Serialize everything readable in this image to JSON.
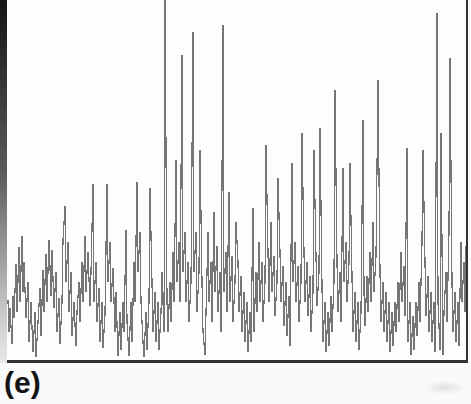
{
  "panel": {
    "label": "(e)"
  },
  "colors": {
    "background": "#fafafa",
    "plot_background": "#fdfdfd",
    "waveform": "#767676",
    "frame": "#323232",
    "label": "#141414",
    "scan_edge_top": "#161616",
    "scan_edge_bottom": "#e8e8e8"
  },
  "chart_data": {
    "type": "line",
    "title": "",
    "xlabel": "",
    "ylabel": "",
    "panel_label": "(e)",
    "axes_visible": false,
    "gridlines": false,
    "legend": "none",
    "frame_style": "open-top box: left, right and bottom borders only; top edge cropped",
    "coordinate_space": "image pixels; x 6-468 within plot box, y 0 (top, clipped) to 361 (bottom border); y increases downward",
    "points": [
      [
        8,
        300
      ],
      [
        9,
        332
      ],
      [
        10,
        308
      ],
      [
        12,
        344
      ],
      [
        13,
        296
      ],
      [
        14,
        318
      ],
      [
        16,
        264
      ],
      [
        17,
        312
      ],
      [
        19,
        247
      ],
      [
        20,
        302
      ],
      [
        22,
        236
      ],
      [
        23,
        292
      ],
      [
        24,
        262
      ],
      [
        26,
        318
      ],
      [
        28,
        282
      ],
      [
        29,
        342
      ],
      [
        31,
        302
      ],
      [
        33,
        352
      ],
      [
        35,
        312
      ],
      [
        36,
        357
      ],
      [
        38,
        322
      ],
      [
        40,
        288
      ],
      [
        41,
        336
      ],
      [
        43,
        270
      ],
      [
        44,
        312
      ],
      [
        46,
        254
      ],
      [
        47,
        302
      ],
      [
        49,
        240
      ],
      [
        51,
        296
      ],
      [
        52,
        250
      ],
      [
        54,
        308
      ],
      [
        56,
        272
      ],
      [
        57,
        332
      ],
      [
        59,
        298
      ],
      [
        60,
        344
      ],
      [
        62,
        302
      ],
      [
        63,
        240
      ],
      [
        65,
        206
      ],
      [
        66,
        282
      ],
      [
        68,
        242
      ],
      [
        69,
        312
      ],
      [
        71,
        272
      ],
      [
        72,
        336
      ],
      [
        74,
        302
      ],
      [
        76,
        346
      ],
      [
        77,
        312
      ],
      [
        79,
        282
      ],
      [
        80,
        322
      ],
      [
        82,
        262
      ],
      [
        83,
        302
      ],
      [
        85,
        236
      ],
      [
        86,
        292
      ],
      [
        88,
        252
      ],
      [
        90,
        306
      ],
      [
        91,
        272
      ],
      [
        93,
        184
      ],
      [
        94,
        302
      ],
      [
        96,
        262
      ],
      [
        97,
        322
      ],
      [
        99,
        288
      ],
      [
        100,
        342
      ],
      [
        102,
        302
      ],
      [
        103,
        348
      ],
      [
        105,
        314
      ],
      [
        107,
        184
      ],
      [
        108,
        282
      ],
      [
        110,
        242
      ],
      [
        111,
        302
      ],
      [
        113,
        268
      ],
      [
        115,
        332
      ],
      [
        116,
        292
      ],
      [
        118,
        356
      ],
      [
        120,
        312
      ],
      [
        121,
        350
      ],
      [
        123,
        302
      ],
      [
        124,
        332
      ],
      [
        126,
        230
      ],
      [
        127,
        322
      ],
      [
        129,
        356
      ],
      [
        131,
        302
      ],
      [
        132,
        342
      ],
      [
        134,
        262
      ],
      [
        135,
        302
      ],
      [
        137,
        182
      ],
      [
        138,
        272
      ],
      [
        140,
        232
      ],
      [
        141,
        302
      ],
      [
        143,
        342
      ],
      [
        144,
        357
      ],
      [
        146,
        312
      ],
      [
        147,
        350
      ],
      [
        149,
        302
      ],
      [
        150,
        188
      ],
      [
        152,
        282
      ],
      [
        153,
        332
      ],
      [
        155,
        292
      ],
      [
        156,
        342
      ],
      [
        158,
        302
      ],
      [
        159,
        350
      ],
      [
        161,
        312
      ],
      [
        162,
        272
      ],
      [
        164,
        332
      ],
      [
        165,
        0
      ],
      [
        167,
        302
      ],
      [
        168,
        332
      ],
      [
        170,
        282
      ],
      [
        171,
        322
      ],
      [
        173,
        252
      ],
      [
        174,
        302
      ],
      [
        176,
        160
      ],
      [
        177,
        282
      ],
      [
        179,
        242
      ],
      [
        180,
        302
      ],
      [
        182,
        55
      ],
      [
        183,
        272
      ],
      [
        185,
        232
      ],
      [
        186,
        302
      ],
      [
        188,
        262
      ],
      [
        189,
        322
      ],
      [
        191,
        282
      ],
      [
        193,
        32
      ],
      [
        194,
        272
      ],
      [
        196,
        232
      ],
      [
        197,
        312
      ],
      [
        199,
        272
      ],
      [
        200,
        150
      ],
      [
        202,
        282
      ],
      [
        203,
        332
      ],
      [
        205,
        355
      ],
      [
        206,
        312
      ],
      [
        208,
        232
      ],
      [
        209,
        302
      ],
      [
        211,
        262
      ],
      [
        212,
        322
      ],
      [
        214,
        212
      ],
      [
        215,
        292
      ],
      [
        217,
        246
      ],
      [
        218,
        312
      ],
      [
        220,
        272
      ],
      [
        221,
        332
      ],
      [
        223,
        25
      ],
      [
        224,
        292
      ],
      [
        226,
        252
      ],
      [
        227,
        312
      ],
      [
        229,
        192
      ],
      [
        230,
        302
      ],
      [
        232,
        256
      ],
      [
        233,
        322
      ],
      [
        235,
        282
      ],
      [
        236,
        222
      ],
      [
        238,
        262
      ],
      [
        239,
        312
      ],
      [
        241,
        276
      ],
      [
        242,
        332
      ],
      [
        244,
        292
      ],
      [
        245,
        342
      ],
      [
        247,
        302
      ],
      [
        248,
        352
      ],
      [
        250,
        312
      ],
      [
        251,
        342
      ],
      [
        253,
        208
      ],
      [
        254,
        332
      ],
      [
        256,
        272
      ],
      [
        257,
        312
      ],
      [
        259,
        242
      ],
      [
        260,
        302
      ],
      [
        262,
        262
      ],
      [
        263,
        322
      ],
      [
        265,
        282
      ],
      [
        266,
        145
      ],
      [
        268,
        252
      ],
      [
        269,
        302
      ],
      [
        271,
        222
      ],
      [
        272,
        292
      ],
      [
        274,
        256
      ],
      [
        275,
        316
      ],
      [
        277,
        282
      ],
      [
        278,
        178
      ],
      [
        280,
        252
      ],
      [
        281,
        302
      ],
      [
        283,
        266
      ],
      [
        284,
        326
      ],
      [
        286,
        282
      ],
      [
        287,
        336
      ],
      [
        289,
        296
      ],
      [
        290,
        346
      ],
      [
        292,
        163
      ],
      [
        293,
        282
      ],
      [
        295,
        242
      ],
      [
        296,
        302
      ],
      [
        298,
        266
      ],
      [
        299,
        322
      ],
      [
        301,
        282
      ],
      [
        302,
        133
      ],
      [
        304,
        252
      ],
      [
        305,
        302
      ],
      [
        307,
        262
      ],
      [
        308,
        316
      ],
      [
        310,
        276
      ],
      [
        311,
        332
      ],
      [
        313,
        292
      ],
      [
        314,
        150
      ],
      [
        316,
        256
      ],
      [
        317,
        306
      ],
      [
        319,
        272
      ],
      [
        320,
        128
      ],
      [
        322,
        286
      ],
      [
        323,
        342
      ],
      [
        325,
        302
      ],
      [
        326,
        352
      ],
      [
        328,
        312
      ],
      [
        329,
        346
      ],
      [
        331,
        296
      ],
      [
        332,
        332
      ],
      [
        334,
        282
      ],
      [
        335,
        90
      ],
      [
        337,
        262
      ],
      [
        338,
        312
      ],
      [
        340,
        272
      ],
      [
        341,
        322
      ],
      [
        343,
        168
      ],
      [
        344,
        282
      ],
      [
        346,
        242
      ],
      [
        347,
        302
      ],
      [
        349,
        263
      ],
      [
        350,
        163
      ],
      [
        352,
        276
      ],
      [
        353,
        332
      ],
      [
        355,
        292
      ],
      [
        356,
        342
      ],
      [
        358,
        302
      ],
      [
        359,
        350
      ],
      [
        361,
        312
      ],
      [
        363,
        120
      ],
      [
        364,
        292
      ],
      [
        365,
        326
      ],
      [
        367,
        276
      ],
      [
        368,
        312
      ],
      [
        370,
        252
      ],
      [
        371,
        302
      ],
      [
        373,
        222
      ],
      [
        374,
        292
      ],
      [
        376,
        256
      ],
      [
        378,
        80
      ],
      [
        380,
        272
      ],
      [
        381,
        322
      ],
      [
        383,
        282
      ],
      [
        384,
        332
      ],
      [
        386,
        292
      ],
      [
        387,
        342
      ],
      [
        389,
        302
      ],
      [
        390,
        352
      ],
      [
        392,
        312
      ],
      [
        393,
        346
      ],
      [
        395,
        302
      ],
      [
        396,
        332
      ],
      [
        398,
        282
      ],
      [
        399,
        322
      ],
      [
        401,
        252
      ],
      [
        402,
        302
      ],
      [
        404,
        266
      ],
      [
        405,
        316
      ],
      [
        407,
        148
      ],
      [
        408,
        342
      ],
      [
        410,
        302
      ],
      [
        411,
        355
      ],
      [
        413,
        316
      ],
      [
        414,
        350
      ],
      [
        416,
        302
      ],
      [
        417,
        336
      ],
      [
        419,
        282
      ],
      [
        420,
        322
      ],
      [
        422,
        242
      ],
      [
        423,
        150
      ],
      [
        425,
        262
      ],
      [
        426,
        316
      ],
      [
        428,
        276
      ],
      [
        429,
        332
      ],
      [
        431,
        292
      ],
      [
        432,
        342
      ],
      [
        434,
        302
      ],
      [
        435,
        352
      ],
      [
        437,
        13
      ],
      [
        438,
        302
      ],
      [
        440,
        350
      ],
      [
        441,
        133
      ],
      [
        443,
        355
      ],
      [
        444,
        312
      ],
      [
        446,
        272
      ],
      [
        447,
        322
      ],
      [
        449,
        232
      ],
      [
        450,
        58
      ],
      [
        452,
        282
      ],
      [
        453,
        332
      ],
      [
        455,
        292
      ],
      [
        456,
        342
      ],
      [
        458,
        302
      ],
      [
        459,
        346
      ],
      [
        461,
        242
      ],
      [
        462,
        302
      ],
      [
        464,
        262
      ],
      [
        465,
        312
      ],
      [
        466,
        246
      ]
    ]
  }
}
